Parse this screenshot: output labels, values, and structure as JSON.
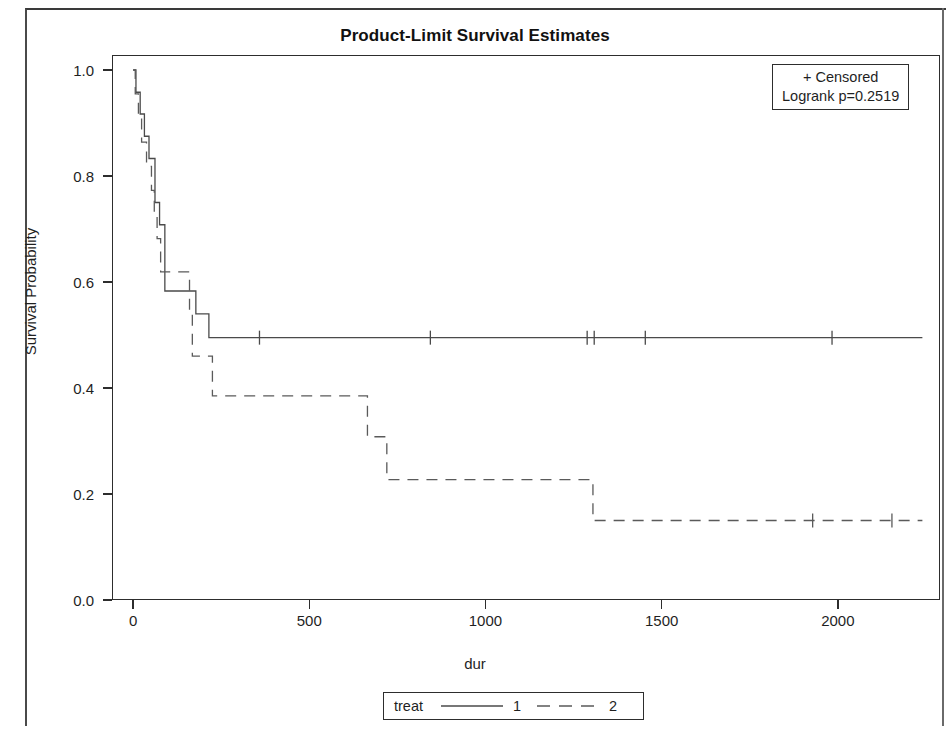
{
  "chart_data": {
    "type": "line",
    "subtype": "kaplan-meier-step",
    "title": "Product-Limit Survival Estimates",
    "xlabel": "dur",
    "ylabel": "Survival Probability",
    "xlim": [
      -60,
      2290
    ],
    "ylim": [
      0.0,
      1.0
    ],
    "xticks": [
      0,
      500,
      1000,
      1500,
      2000
    ],
    "xtick_labels": [
      "0",
      "500",
      "1000",
      "1500",
      "2000"
    ],
    "yticks": [
      0.0,
      0.2,
      0.4,
      0.6,
      0.8,
      1.0
    ],
    "ytick_labels": [
      "0.0",
      "0.2",
      "0.4",
      "0.6",
      "0.8",
      "1.0"
    ],
    "grid": false,
    "legend_position": "bottom-outside",
    "annotation_position": "top-right-inside",
    "series": [
      {
        "name": "1",
        "group": "treat",
        "linestyle": "solid",
        "color": "#4a4a4a",
        "steps": [
          {
            "x": 0,
            "y": 1.0
          },
          {
            "x": 8,
            "y": 0.958
          },
          {
            "x": 20,
            "y": 0.917
          },
          {
            "x": 32,
            "y": 0.875
          },
          {
            "x": 45,
            "y": 0.833
          },
          {
            "x": 62,
            "y": 0.75
          },
          {
            "x": 75,
            "y": 0.708
          },
          {
            "x": 90,
            "y": 0.583
          },
          {
            "x": 175,
            "y": 0.583
          },
          {
            "x": 178,
            "y": 0.54
          },
          {
            "x": 215,
            "y": 0.495
          },
          {
            "x": 2240,
            "y": 0.495
          }
        ],
        "censored_x": [
          360,
          845,
          1290,
          1310,
          1455,
          1985
        ],
        "censored_y": 0.495
      },
      {
        "name": "2",
        "group": "treat",
        "linestyle": "dashed",
        "color": "#5a5a5a",
        "steps": [
          {
            "x": 0,
            "y": 1.0
          },
          {
            "x": 6,
            "y": 0.955
          },
          {
            "x": 15,
            "y": 0.909
          },
          {
            "x": 24,
            "y": 0.864
          },
          {
            "x": 38,
            "y": 0.818
          },
          {
            "x": 52,
            "y": 0.773
          },
          {
            "x": 60,
            "y": 0.727
          },
          {
            "x": 68,
            "y": 0.682
          },
          {
            "x": 78,
            "y": 0.619
          },
          {
            "x": 155,
            "y": 0.619
          },
          {
            "x": 160,
            "y": 0.54
          },
          {
            "x": 168,
            "y": 0.46
          },
          {
            "x": 225,
            "y": 0.385
          },
          {
            "x": 640,
            "y": 0.385
          },
          {
            "x": 665,
            "y": 0.308
          },
          {
            "x": 720,
            "y": 0.227
          },
          {
            "x": 1300,
            "y": 0.227
          },
          {
            "x": 1305,
            "y": 0.15
          },
          {
            "x": 2240,
            "y": 0.15
          }
        ],
        "censored_x": [
          1930,
          2155
        ],
        "censored_y": 0.15
      }
    ],
    "annotations": {
      "censored_marker_text": "+ Censored",
      "logrank_text": "Logrank p=0.2519",
      "logrank_p_value": 0.2519
    }
  },
  "title": {
    "text": "Product-Limit Survival Estimates"
  },
  "axes": {
    "x_title": "dur",
    "y_title": "Survival Probability",
    "x_tick_labels": [
      "0",
      "500",
      "1000",
      "1500",
      "2000"
    ],
    "y_tick_labels": [
      "0.0",
      "0.2",
      "0.4",
      "0.6",
      "0.8",
      "1.0"
    ]
  },
  "inset": {
    "line1": "+ Censored",
    "line2": "Logrank p=0.2519"
  },
  "legend": {
    "title": "treat",
    "entries": [
      {
        "label": "1",
        "style": "solid"
      },
      {
        "label": "2",
        "style": "dashed"
      }
    ]
  },
  "colors": {
    "line": "#4a4a4a",
    "axis": "#2d2d2d",
    "text": "#1f1f1f",
    "background": "#ffffff"
  }
}
